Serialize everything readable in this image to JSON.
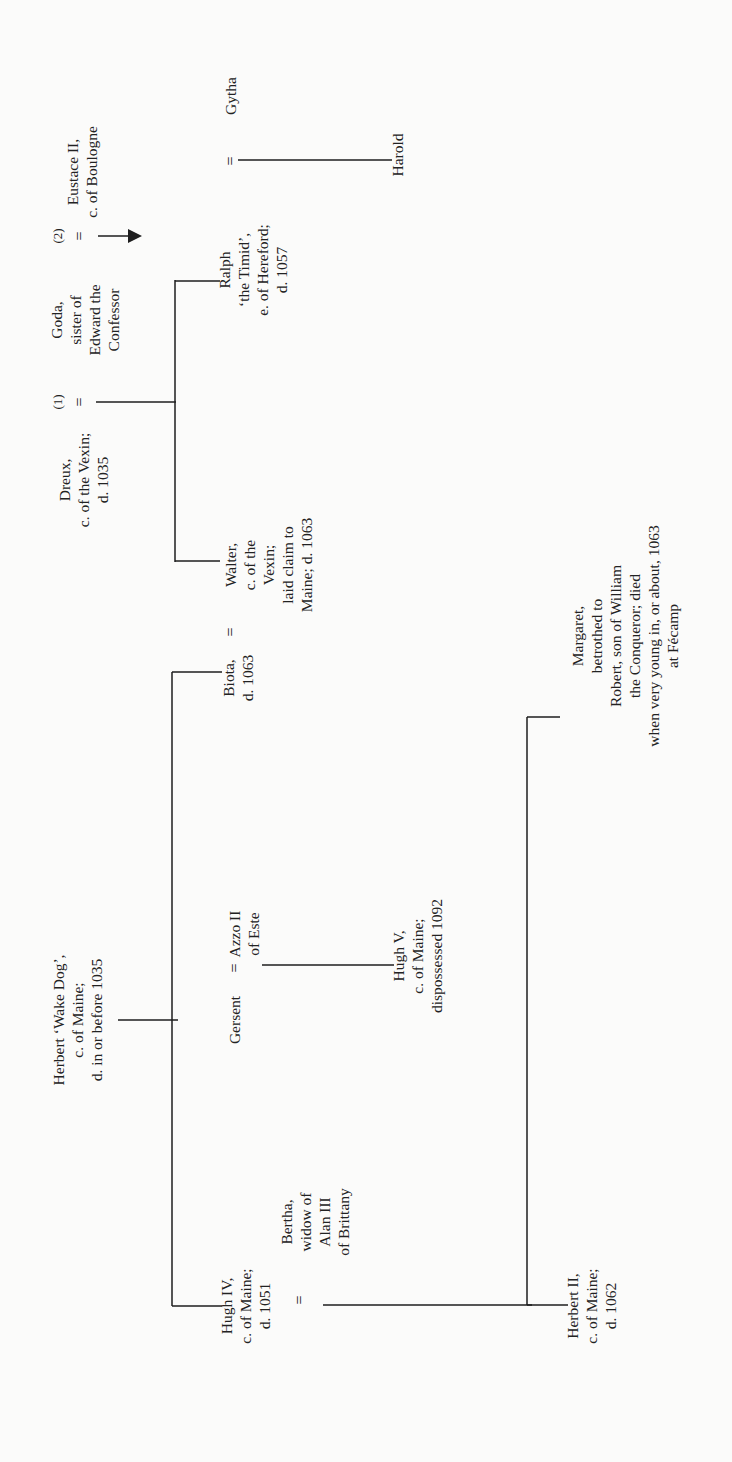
{
  "diagram": {
    "type": "family-tree",
    "orientation": "rotated-90-ccw",
    "persons": {
      "herbert_wake_dog": [
        "Herbert ‘Wake Dog’,",
        "c. of Maine;",
        "d. in or before 1035"
      ],
      "hugh_iv": [
        "Hugh IV,",
        "c. of Maine;",
        "d. 1051"
      ],
      "bertha": [
        "Bertha,",
        "widow of",
        "Alan III",
        "of Brittany"
      ],
      "gersent": [
        "Gersent"
      ],
      "azzo": [
        "Azzo II",
        "of Este"
      ],
      "biota": [
        "Biota,",
        "d. 1063"
      ],
      "walter": [
        "Walter,",
        "c. of the",
        "Vexin;",
        "laid claim to",
        "Maine; d. 1063"
      ],
      "dreux": [
        "Dreux,",
        "c. of the Vexin;",
        "d. 1035"
      ],
      "goda": [
        "Goda,",
        "sister of",
        "Edward the",
        "Confessor"
      ],
      "eustace": [
        "Eustace II,",
        "c. of Boulogne"
      ],
      "ralph": [
        "Ralph",
        "‘the Timid’,",
        "e. of Hereford;",
        "d. 1057"
      ],
      "gytha": [
        "Gytha"
      ],
      "harold": [
        "Harold"
      ],
      "hugh_v": [
        "Hugh V,",
        "c. of Maine;",
        "dispossessed 1092"
      ],
      "herbert_ii": [
        "Herbert II,",
        "c. of Maine;",
        "d. 1062"
      ],
      "margaret": [
        "Margaret,",
        "betrothed to",
        "Robert, son of William",
        "the Conqueror; died",
        "when very young in, or about, 1063",
        "at Fécamp"
      ]
    },
    "marks": {
      "marriage": "=",
      "marriage_1": "(1)",
      "marriage_2": "(2)"
    },
    "relations": [
      {
        "from": "herbert_wake_dog",
        "children": [
          "hugh_iv",
          "gersent",
          "biota"
        ]
      },
      {
        "couple": [
          "gersent",
          "azzo"
        ],
        "children": [
          "hugh_v"
        ]
      },
      {
        "couple": [
          "biota",
          "walter"
        ]
      },
      {
        "couple": [
          "dreux",
          "goda"
        ],
        "marriage": "(1)",
        "children": [
          "walter",
          "ralph"
        ]
      },
      {
        "couple": [
          "goda",
          "eustace"
        ],
        "marriage": "(2)"
      },
      {
        "couple": [
          "ralph",
          "gytha"
        ],
        "children": [
          "harold"
        ]
      },
      {
        "couple": [
          "hugh_iv",
          "bertha"
        ],
        "children": [
          "herbert_ii",
          "margaret"
        ]
      }
    ]
  }
}
